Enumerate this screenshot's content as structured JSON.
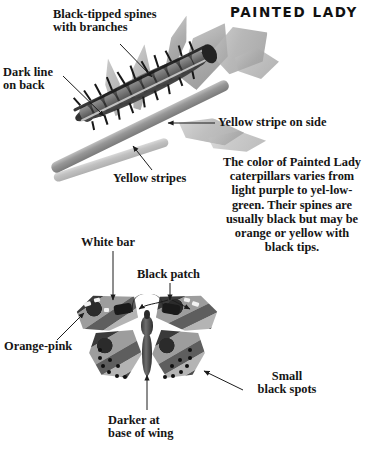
{
  "page": {
    "title": "PAINTED LADY",
    "background_color": "#ffffff",
    "text_color": "#151515"
  },
  "body_text": "The color of Painted Lady caterpillars varies from light purple to yel-low-green. Their spines are usually black but may be orange or yellow with black tips.",
  "caterpillar": {
    "image_name": "painted-lady-caterpillar-photo",
    "labels": [
      {
        "id": "black-tipped-spines",
        "line1": "Black-tipped spines",
        "line2": "with branches"
      },
      {
        "id": "dark-line-on-back",
        "line1": "Dark line",
        "line2": "on back"
      },
      {
        "id": "yellow-stripe-on-side",
        "line1": "Yellow stripe on side",
        "line2": ""
      },
      {
        "id": "yellow-stripes",
        "line1": "Yellow stripes",
        "line2": ""
      }
    ]
  },
  "butterfly": {
    "image_name": "painted-lady-butterfly-photo",
    "labels": [
      {
        "id": "white-bar",
        "line1": "White bar",
        "line2": ""
      },
      {
        "id": "black-patch",
        "line1": "Black patch",
        "line2": ""
      },
      {
        "id": "orange-pink",
        "line1": "Orange-pink",
        "line2": ""
      },
      {
        "id": "small-black-spots",
        "line1": "Small",
        "line2": "black spots"
      },
      {
        "id": "darker-at-base",
        "line1": "Darker at",
        "line2": "base of wing"
      }
    ]
  }
}
